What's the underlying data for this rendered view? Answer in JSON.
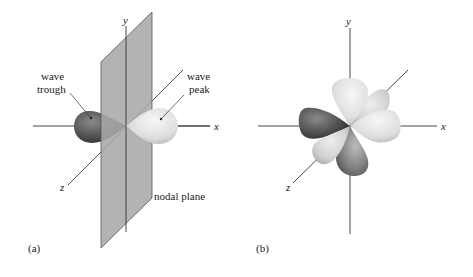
{
  "figure": {
    "panels": [
      {
        "id": "a",
        "label": "(a)",
        "axes": {
          "x": "x",
          "y": "y",
          "z": "z"
        },
        "annotations": {
          "trough_line1": "wave",
          "trough_line2": "trough",
          "peak_line1": "wave",
          "peak_line2": "peak",
          "nodal_plane": "nodal plane"
        },
        "description": "p orbital: two lobes along x-axis separated by a nodal plane (yz-plane)"
      },
      {
        "id": "b",
        "label": "(b)",
        "axes": {
          "x": "x",
          "y": "y",
          "z": "z"
        },
        "description": "d orbital: four-lobed cloverleaf at origin"
      }
    ],
    "colors": {
      "plane_fill": "#a9a9a9",
      "plane_edge": "#555555",
      "axis": "#333333",
      "lobe_dark": "#4a4a4a",
      "lobe_light": "#e2e2e2"
    }
  }
}
